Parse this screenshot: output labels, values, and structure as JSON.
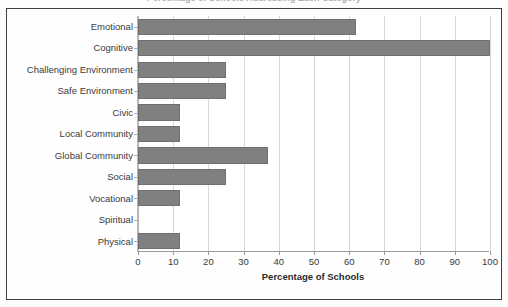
{
  "figure": {
    "clipped_title": "Percentage of Schools Addressing Each Category",
    "bar_color": "#808080",
    "bar_edge_color": "#6f6f6f",
    "grid_color": "#d9d9d9",
    "axis_color": "#9a9a9a",
    "frame_color": "#3f3f3f",
    "text_color": "#3a3a3a"
  },
  "chart_data": {
    "type": "bar",
    "orientation": "horizontal",
    "title": "",
    "xlabel": "Percentage of Schools",
    "ylabel": "",
    "xlim": [
      0,
      100
    ],
    "xticks": [
      0,
      10,
      20,
      30,
      40,
      50,
      60,
      70,
      80,
      90,
      100
    ],
    "xticklabels": [
      "0",
      "10",
      "20",
      "30",
      "40",
      "50",
      "60",
      "70",
      "80",
      "90",
      "100"
    ],
    "grid": true,
    "grid_axis": "x",
    "legend": false,
    "categories": [
      "Emotional",
      "Cognitive",
      "Challenging Environment",
      "Safe Environment",
      "Civic",
      "Local Community",
      "Global Community",
      "Social",
      "Vocational",
      "Spiritual",
      "Physical"
    ],
    "values": [
      62,
      100,
      25,
      25,
      12,
      12,
      37,
      25,
      12,
      0,
      12
    ],
    "series": [
      {
        "name": "Percentage of Schools",
        "values": [
          62,
          100,
          25,
          25,
          12,
          12,
          37,
          25,
          12,
          0,
          12
        ]
      }
    ]
  }
}
